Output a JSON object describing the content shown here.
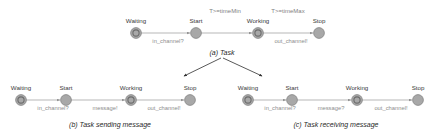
{
  "figure": {
    "background_color": "#ffffff",
    "node_fill": "#a8a8a8",
    "node_stroke": "#7c7c7c",
    "edge_color": "#9a9a9a",
    "branch_arrow_color": "#2f2f2f",
    "label_color": "#8d8d8d",
    "state_label_color": "#3a3a3a"
  },
  "diagrams": [
    {
      "id": "a",
      "caption": "(a) Task",
      "states": [
        {
          "name": "Waiting",
          "initial": true
        },
        {
          "name": "Start",
          "initial": false
        },
        {
          "name": "Working",
          "initial": false
        },
        {
          "name": "Stop",
          "initial": false
        }
      ],
      "transitions": [
        {
          "from": "Waiting",
          "to": "Start",
          "guard": "",
          "sync": "in_channel?"
        },
        {
          "from": "Start",
          "to": "Working",
          "guard": "T>=timeMin",
          "sync": ""
        },
        {
          "from": "Working",
          "to": "Stop",
          "guard": "T>=timeMax",
          "sync": "out_channel!"
        }
      ]
    },
    {
      "id": "b",
      "caption": "(b) Task sending message",
      "states": [
        {
          "name": "Waiting",
          "initial": true
        },
        {
          "name": "Start",
          "initial": false
        },
        {
          "name": "Working",
          "initial": false
        },
        {
          "name": "Stop",
          "initial": false
        }
      ],
      "transitions": [
        {
          "from": "Waiting",
          "to": "Start",
          "guard": "",
          "sync": "in_channel?"
        },
        {
          "from": "Start",
          "to": "Working",
          "guard": "",
          "sync": "message!"
        },
        {
          "from": "Working",
          "to": "Stop",
          "guard": "",
          "sync": "out_channel!"
        }
      ]
    },
    {
      "id": "c",
      "caption": "(c) Task receiving message",
      "states": [
        {
          "name": "Waiting",
          "initial": true
        },
        {
          "name": "Start",
          "initial": false
        },
        {
          "name": "Working",
          "initial": false
        },
        {
          "name": "Stop",
          "initial": false
        }
      ],
      "transitions": [
        {
          "from": "Waiting",
          "to": "Start",
          "guard": "",
          "sync": "in_channel?"
        },
        {
          "from": "Start",
          "to": "Working",
          "guard": "",
          "sync": "message?"
        },
        {
          "from": "Working",
          "to": "Stop",
          "guard": "",
          "sync": "out_channel!"
        }
      ]
    }
  ]
}
